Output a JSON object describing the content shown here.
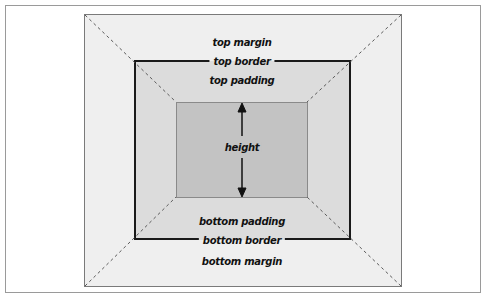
{
  "diagram": {
    "type": "css-box-model",
    "colors": {
      "margin_fill": "#efefef",
      "padding_fill": "#dcdcdc",
      "content_fill": "#c3c3c3",
      "border_line": "#1a1a1a",
      "dashed_line": "#666666"
    },
    "labels": {
      "top_margin": "top margin",
      "top_border": "top border",
      "top_padding": "top padding",
      "height": "height",
      "bottom_padding": "bottom padding",
      "bottom_border": "bottom border",
      "bottom_margin": "bottom margin"
    }
  }
}
